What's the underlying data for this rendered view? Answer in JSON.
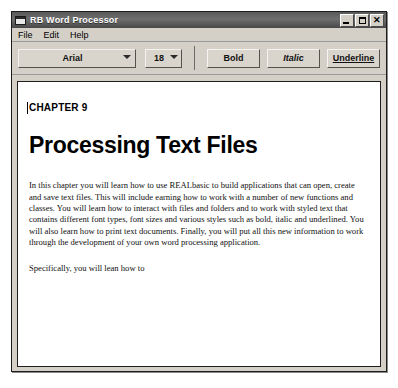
{
  "window": {
    "title": "RB Word Processor",
    "icon": "window-document-icon",
    "controls": {
      "minimize_label": "",
      "maximize_label": "",
      "close_label": "✕"
    }
  },
  "menu": {
    "items": [
      {
        "label": "File"
      },
      {
        "label": "Edit"
      },
      {
        "label": "Help"
      }
    ]
  },
  "toolbar": {
    "font": {
      "value": "Arial",
      "icon": "chevron-down-icon"
    },
    "size": {
      "value": "18",
      "icon": "chevron-down-icon"
    },
    "bold_label": "Bold",
    "italic_label": "Italic",
    "underline_label": "Underline"
  },
  "document": {
    "chapter": "CHAPTER 9",
    "title": "Processing Text Files",
    "paragraph": "In this chapter you will learn how to use REALbasic to build applications that can open, create and save text files. This will include earning how to work with a number of new functions and classes. You will learn how to interact with files and folders and to work with styled text that contains different font types, font sizes and various styles such as bold, italic and underlined. You will also learn how to print text documents. Finally, you will put all this new information to work through the development of your own word processing application.",
    "closing": "Specifically, you will lean how to"
  }
}
